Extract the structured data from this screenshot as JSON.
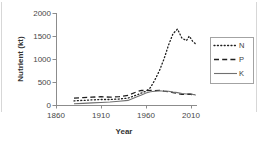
{
  "chart_data": {
    "type": "line",
    "title": "",
    "xlabel": "Year",
    "ylabel": "Nutrient (kt)",
    "xlim": [
      1860,
      2018
    ],
    "ylim": [
      0,
      2000
    ],
    "x_ticks": [
      1860,
      1910,
      1960,
      2010
    ],
    "y_ticks": [
      0,
      500,
      1000,
      1500,
      2000
    ],
    "grid": false,
    "legend_position": "right",
    "x": [
      1880,
      1890,
      1900,
      1910,
      1920,
      1930,
      1940,
      1950,
      1955,
      1960,
      1965,
      1970,
      1975,
      1980,
      1985,
      1990,
      1995,
      2000,
      2005,
      2008,
      2012,
      2015
    ],
    "series": [
      {
        "name": "N",
        "style": "dotted",
        "color": "#1f1f1f",
        "values": [
          90,
          100,
          110,
          120,
          120,
          130,
          150,
          220,
          260,
          300,
          380,
          550,
          750,
          1000,
          1300,
          1550,
          1650,
          1450,
          1400,
          1500,
          1380,
          1330
        ]
      },
      {
        "name": "P",
        "style": "dashed",
        "color": "#1f1f1f",
        "values": [
          150,
          160,
          170,
          180,
          170,
          180,
          210,
          290,
          320,
          310,
          320,
          310,
          320,
          300,
          290,
          270,
          250,
          230,
          230,
          240,
          220,
          210
        ]
      },
      {
        "name": "K",
        "style": "solid",
        "color": "#707070",
        "values": [
          25,
          35,
          45,
          55,
          65,
          80,
          100,
          180,
          220,
          260,
          290,
          300,
          310,
          300,
          300,
          280,
          270,
          250,
          240,
          250,
          230,
          220
        ]
      }
    ]
  },
  "colors": {
    "axis": "#8c8c8c",
    "tick_label": "#474747",
    "legend_border": "#a3a3a3",
    "background": "#ffffff",
    "edge_line": "#d7d7d7"
  }
}
